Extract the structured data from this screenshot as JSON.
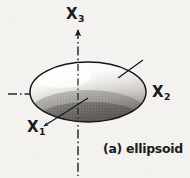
{
  "figure": {
    "caption": "(a) ellipsoid",
    "background_color": "#f3f2ef",
    "ink_color": "#1a1a1a",
    "axes": [
      {
        "id": "x3",
        "label": "X",
        "subscript": "3",
        "orientation": "vertical",
        "arrow": "up",
        "line_style": "dash-dot"
      },
      {
        "id": "x2",
        "label": "X",
        "subscript": "2",
        "orientation": "horizontal",
        "arrow": "right",
        "line_style": "dash-dot"
      },
      {
        "id": "x1",
        "label": "X",
        "subscript": "1",
        "orientation": "oblique",
        "arrow": "leader-line",
        "line_style": "solid"
      }
    ],
    "shape": {
      "name": "ellipsoid",
      "center_x": 88,
      "center_y": 92,
      "radius_x": 58,
      "radius_y": 30,
      "shading": "stippled-halftone",
      "highlight": "top-left",
      "shadow": "bottom"
    },
    "annotations": [
      {
        "id": "upper-right-leader",
        "text": "",
        "target": "ellipsoid-surface"
      }
    ]
  }
}
